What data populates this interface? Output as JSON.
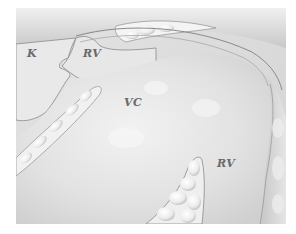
{
  "figure": {
    "type": "anatomical-illustration",
    "colors": {
      "background": "#ffffff",
      "tissue_light": "#eeeeee",
      "tissue_mid": "#d8d8d8",
      "tissue_dark": "#b8b8b8",
      "outline": "#8a8a8a",
      "label": "#6a6a6a"
    },
    "labels": [
      {
        "id": "k",
        "text": "K",
        "x": 27,
        "y": 48
      },
      {
        "id": "rv-top",
        "text": "RV",
        "x": 83,
        "y": 48
      },
      {
        "id": "vc",
        "text": "VC",
        "x": 124,
        "y": 97
      },
      {
        "id": "rv-bottom",
        "text": "RV",
        "x": 217,
        "y": 158
      }
    ]
  }
}
